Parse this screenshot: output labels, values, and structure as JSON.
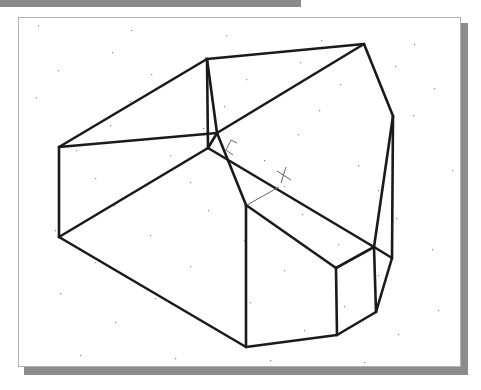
{
  "drawing": {
    "ucs_icon": {
      "x_label": "X",
      "y_label": "Y"
    },
    "colors": {
      "edge": "#1a1a1a",
      "grid": "#888888",
      "ucs": "#666666"
    },
    "vertices": {
      "A": [
        59,
        147
      ],
      "B": [
        207,
        59
      ],
      "D": [
        364,
        44
      ],
      "E": [
        393,
        116
      ],
      "C": [
        217,
        133
      ],
      "F": [
        208,
        148
      ],
      "G": [
        246,
        205
      ],
      "H": [
        336,
        268
      ],
      "I": [
        374,
        247
      ],
      "J": [
        392,
        258
      ],
      "K": [
        376,
        312
      ],
      "L": [
        337,
        335
      ],
      "M": [
        59,
        237
      ],
      "N": [
        246,
        347
      ]
    },
    "edges": [
      [
        "A",
        "B"
      ],
      [
        "B",
        "D"
      ],
      [
        "D",
        "E"
      ],
      [
        "B",
        "C"
      ],
      [
        "A",
        "C"
      ],
      [
        "C",
        "D"
      ],
      [
        "C",
        "G"
      ],
      [
        "F",
        "M"
      ],
      [
        "F",
        "I"
      ],
      [
        "A",
        "M"
      ],
      [
        "M",
        "N"
      ],
      [
        "G",
        "N"
      ],
      [
        "G",
        "H"
      ],
      [
        "H",
        "I"
      ],
      [
        "I",
        "E"
      ],
      [
        "E",
        "J"
      ],
      [
        "J",
        "K"
      ],
      [
        "K",
        "L"
      ],
      [
        "L",
        "N"
      ],
      [
        "H",
        "L"
      ],
      [
        "I",
        "K"
      ],
      [
        "I",
        "J"
      ],
      [
        "C",
        "F"
      ],
      [
        "B",
        "F"
      ]
    ],
    "grid_dots": [
      [
        38,
        25
      ],
      [
        131,
        30
      ],
      [
        226,
        35
      ],
      [
        321,
        40
      ],
      [
        414,
        44
      ],
      [
        112,
        52
      ],
      [
        205,
        57
      ],
      [
        300,
        62
      ],
      [
        395,
        66
      ],
      [
        58,
        70
      ],
      [
        151,
        74
      ],
      [
        246,
        79
      ],
      [
        340,
        84
      ],
      [
        434,
        88
      ],
      [
        36,
        97
      ],
      [
        130,
        101
      ],
      [
        224,
        106
      ],
      [
        319,
        110
      ],
      [
        413,
        115
      ],
      [
        110,
        125
      ],
      [
        203,
        128
      ],
      [
        298,
        134
      ],
      [
        392,
        138
      ],
      [
        76,
        150
      ],
      [
        170,
        155
      ],
      [
        264,
        160
      ],
      [
        358,
        165
      ],
      [
        452,
        170
      ],
      [
        95,
        178
      ],
      [
        190,
        182
      ],
      [
        284,
        186
      ],
      [
        378,
        190
      ],
      [
        114,
        205
      ],
      [
        208,
        210
      ],
      [
        302,
        214
      ],
      [
        396,
        218
      ],
      [
        55,
        230
      ],
      [
        150,
        235
      ],
      [
        244,
        240
      ],
      [
        338,
        244
      ],
      [
        432,
        249
      ],
      [
        95,
        262
      ],
      [
        190,
        266
      ],
      [
        284,
        270
      ],
      [
        378,
        275
      ],
      [
        60,
        293
      ],
      [
        155,
        298
      ],
      [
        250,
        302
      ],
      [
        344,
        306
      ],
      [
        438,
        310
      ],
      [
        115,
        322
      ],
      [
        210,
        326
      ],
      [
        304,
        330
      ],
      [
        398,
        334
      ],
      [
        80,
        355
      ],
      [
        175,
        358
      ],
      [
        270,
        360
      ],
      [
        364,
        362
      ]
    ]
  }
}
